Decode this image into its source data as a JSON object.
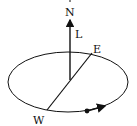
{
  "diagram": {
    "labels": {
      "north": "N",
      "angular_momentum": "L",
      "east": "E",
      "west": "W"
    },
    "colors": {
      "stroke": "#111111",
      "background": "#ffffff"
    }
  }
}
